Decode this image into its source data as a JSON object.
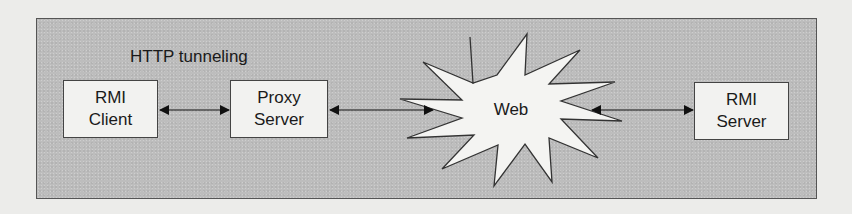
{
  "diagram": {
    "title_label": "HTTP tunneling",
    "nodes": [
      {
        "id": "rmi-client",
        "line1": "RMI",
        "line2": "Client",
        "shape": "rectangle"
      },
      {
        "id": "proxy-server",
        "line1": "Proxy",
        "line2": "Server",
        "shape": "rectangle"
      },
      {
        "id": "web",
        "label": "Web",
        "shape": "starburst"
      },
      {
        "id": "rmi-server",
        "line1": "RMI",
        "line2": "Server",
        "shape": "rectangle"
      }
    ],
    "edges": [
      {
        "from": "rmi-client",
        "to": "proxy-server",
        "direction": "bidirectional"
      },
      {
        "from": "proxy-server",
        "to": "web",
        "direction": "bidirectional"
      },
      {
        "from": "web",
        "to": "rmi-server",
        "direction": "bidirectional"
      }
    ],
    "colors": {
      "page_background": "#ececea",
      "frame_fill": "#bdbdbd",
      "frame_border": "#555555",
      "node_fill": "#f2f2f0",
      "node_border": "#444444",
      "text": "#1a1a1a",
      "arrow": "#111111"
    }
  }
}
